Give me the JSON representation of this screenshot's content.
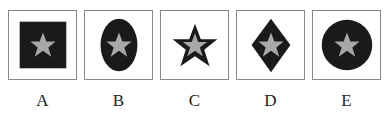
{
  "colors": {
    "dark": "#1a1a1a",
    "star": "#a8a8a8",
    "border": "#8a8a8a"
  },
  "options": [
    {
      "label": "A",
      "shape": "square"
    },
    {
      "label": "B",
      "shape": "ellipse"
    },
    {
      "label": "C",
      "shape": "star"
    },
    {
      "label": "D",
      "shape": "diamond"
    },
    {
      "label": "E",
      "shape": "circle"
    }
  ]
}
